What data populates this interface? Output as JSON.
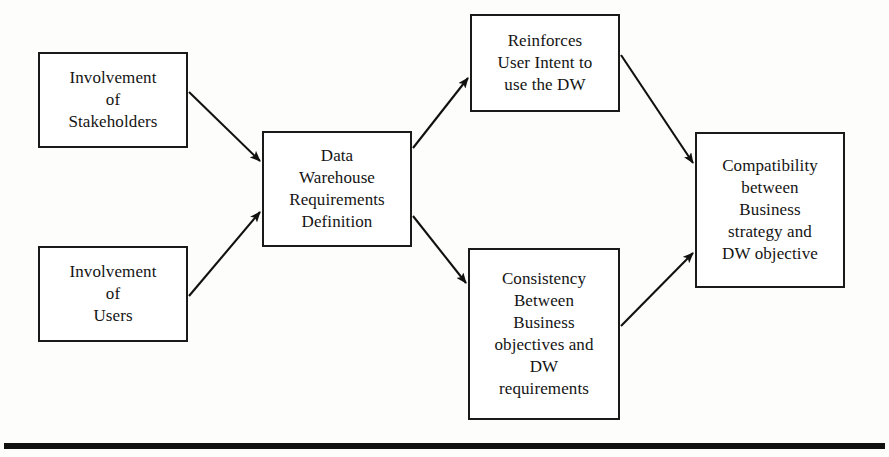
{
  "diagram": {
    "type": "flowchart",
    "colors": {
      "node_border": "#1a1a1a",
      "node_fill": "#ffffff",
      "text": "#141414",
      "edge": "#111111",
      "background": "#fdfdfc",
      "rule": "#111111"
    },
    "nodes": [
      {
        "id": "involvement-stakeholders",
        "label": "Involvement\nof\nStakeholders",
        "x": 38,
        "y": 52,
        "w": 150,
        "h": 96
      },
      {
        "id": "involvement-users",
        "label": "Involvement\nof\nUsers",
        "x": 38,
        "y": 246,
        "w": 150,
        "h": 96
      },
      {
        "id": "dw-requirements-definition",
        "label": "Data\nWarehouse\nRequirements\nDefinition",
        "x": 262,
        "y": 131,
        "w": 150,
        "h": 116
      },
      {
        "id": "reinforces-user-intent",
        "label": "Reinforces\nUser Intent to\nuse the DW",
        "x": 470,
        "y": 14,
        "w": 150,
        "h": 98
      },
      {
        "id": "consistency-business-dw",
        "label": "Consistency\nBetween\nBusiness\nobjectives and\nDW\nrequirements",
        "x": 468,
        "y": 248,
        "w": 152,
        "h": 172
      },
      {
        "id": "compatibility-strategy-objective",
        "label": "Compatibility\nbetween\nBusiness\nstrategy and\nDW objective",
        "x": 695,
        "y": 132,
        "w": 150,
        "h": 156
      }
    ],
    "edges": [
      {
        "id": "stakeholders-to-requirements",
        "from": "involvement-stakeholders",
        "to": "dw-requirements-definition",
        "x1": 189,
        "y1": 92,
        "x2": 260,
        "y2": 161
      },
      {
        "id": "users-to-requirements",
        "from": "involvement-users",
        "to": "dw-requirements-definition",
        "x1": 189,
        "y1": 296,
        "x2": 260,
        "y2": 212
      },
      {
        "id": "requirements-to-reinforces",
        "from": "dw-requirements-definition",
        "to": "reinforces-user-intent",
        "x1": 413,
        "y1": 148,
        "x2": 468,
        "y2": 78
      },
      {
        "id": "requirements-to-consistency",
        "from": "dw-requirements-definition",
        "to": "consistency-business-dw",
        "x1": 413,
        "y1": 216,
        "x2": 466,
        "y2": 283
      },
      {
        "id": "reinforces-to-compatibility",
        "from": "reinforces-user-intent",
        "to": "compatibility-strategy-objective",
        "x1": 621,
        "y1": 55,
        "x2": 693,
        "y2": 163
      },
      {
        "id": "consistency-to-compatibility",
        "from": "consistency-business-dw",
        "to": "compatibility-strategy-objective",
        "x1": 621,
        "y1": 326,
        "x2": 693,
        "y2": 253
      }
    ],
    "rule": {
      "id": "bottom-rule",
      "x": 4,
      "y": 443,
      "w": 881,
      "h": 6
    }
  }
}
